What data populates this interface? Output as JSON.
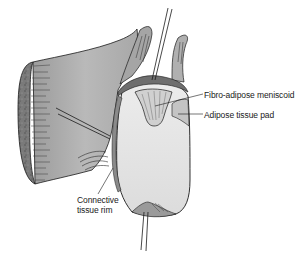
{
  "figure": {
    "labels": {
      "meniscoid": "Fibro-adipose meniscoid",
      "adipose_pad": "Adipose tissue pad",
      "rim_line1": "Connective",
      "rim_line2": "tissue rim"
    },
    "colors": {
      "background": "#ffffff",
      "capsule_fill": "#b8b8b8",
      "capsule_shade": "#8e8e8e",
      "cut_edge": "#6e6e6e",
      "articular_surface": "#e6e6e6",
      "meniscoid_fill": "#d4d4d4",
      "outline": "#1a1a1a"
    }
  }
}
